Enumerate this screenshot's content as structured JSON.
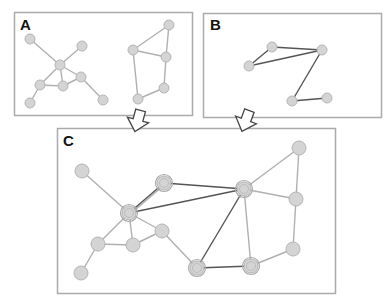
{
  "panels": {
    "A": {
      "label": "A",
      "box": [
        14,
        12,
        178,
        103
      ],
      "nodes": [
        {
          "id": "a1",
          "x": 30,
          "y": 39
        },
        {
          "id": "a2",
          "x": 82,
          "y": 46
        },
        {
          "id": "a3",
          "x": 60,
          "y": 65
        },
        {
          "id": "a4",
          "x": 81,
          "y": 77
        },
        {
          "id": "a5",
          "x": 40,
          "y": 85
        },
        {
          "id": "a6",
          "x": 63,
          "y": 86
        },
        {
          "id": "a7",
          "x": 30,
          "y": 103
        },
        {
          "id": "a8",
          "x": 103,
          "y": 100
        },
        {
          "id": "a9",
          "x": 169,
          "y": 25
        },
        {
          "id": "a10",
          "x": 133,
          "y": 50
        },
        {
          "id": "a11",
          "x": 166,
          "y": 57
        },
        {
          "id": "a12",
          "x": 164,
          "y": 88
        },
        {
          "id": "a13",
          "x": 138,
          "y": 99
        }
      ],
      "edges": [
        [
          "a1",
          "a3"
        ],
        [
          "a2",
          "a3"
        ],
        [
          "a3",
          "a5"
        ],
        [
          "a3",
          "a6"
        ],
        [
          "a3",
          "a4"
        ],
        [
          "a5",
          "a6"
        ],
        [
          "a6",
          "a4"
        ],
        [
          "a5",
          "a7"
        ],
        [
          "a4",
          "a8"
        ],
        [
          "a9",
          "a10"
        ],
        [
          "a9",
          "a11"
        ],
        [
          "a10",
          "a11"
        ],
        [
          "a10",
          "a13"
        ],
        [
          "a11",
          "a12"
        ],
        [
          "a12",
          "a13"
        ]
      ]
    },
    "B": {
      "label": "B",
      "box": [
        203,
        13,
        178,
        104
      ],
      "nodes": [
        {
          "id": "b1",
          "x": 272,
          "y": 47
        },
        {
          "id": "b2",
          "x": 249,
          "y": 66
        },
        {
          "id": "b3",
          "x": 322,
          "y": 50
        },
        {
          "id": "b4",
          "x": 292,
          "y": 101
        },
        {
          "id": "b5",
          "x": 327,
          "y": 98
        }
      ],
      "edges": [
        [
          "b1",
          "b3"
        ],
        [
          "b2",
          "b1"
        ],
        [
          "b2",
          "b3"
        ],
        [
          "b3",
          "b4"
        ],
        [
          "b4",
          "b5"
        ]
      ]
    },
    "C": {
      "label": "C",
      "box": [
        57,
        128,
        278,
        165
      ],
      "nodes": [
        {
          "id": "c1",
          "x": 82,
          "y": 171,
          "double": false
        },
        {
          "id": "c2",
          "x": 164,
          "y": 183,
          "double": true
        },
        {
          "id": "c3",
          "x": 129,
          "y": 213,
          "double": true
        },
        {
          "id": "c4",
          "x": 162,
          "y": 231,
          "double": false
        },
        {
          "id": "c5",
          "x": 98,
          "y": 244,
          "double": false
        },
        {
          "id": "c6",
          "x": 133,
          "y": 245,
          "double": false
        },
        {
          "id": "c7",
          "x": 81,
          "y": 273,
          "double": false
        },
        {
          "id": "c8",
          "x": 197,
          "y": 268,
          "double": true
        },
        {
          "id": "c9",
          "x": 299,
          "y": 148,
          "double": false
        },
        {
          "id": "c10",
          "x": 244,
          "y": 189,
          "double": true
        },
        {
          "id": "c11",
          "x": 296,
          "y": 199,
          "double": false
        },
        {
          "id": "c12",
          "x": 293,
          "y": 249,
          "double": false
        },
        {
          "id": "c13",
          "x": 251,
          "y": 266,
          "double": true
        }
      ],
      "light_edges": [
        [
          "c1",
          "c3"
        ],
        [
          "c3",
          "c2"
        ],
        [
          "c3",
          "c5"
        ],
        [
          "c3",
          "c6"
        ],
        [
          "c3",
          "c4"
        ],
        [
          "c5",
          "c6"
        ],
        [
          "c6",
          "c4"
        ],
        [
          "c5",
          "c7"
        ],
        [
          "c4",
          "c8"
        ],
        [
          "c9",
          "c10"
        ],
        [
          "c9",
          "c11"
        ],
        [
          "c10",
          "c11"
        ],
        [
          "c10",
          "c13"
        ],
        [
          "c11",
          "c12"
        ],
        [
          "c12",
          "c13"
        ]
      ],
      "dark_edges": [
        [
          "c3",
          "c2"
        ],
        [
          "c2",
          "c10"
        ],
        [
          "c3",
          "c10"
        ],
        [
          "c10",
          "c8"
        ],
        [
          "c8",
          "c13"
        ]
      ]
    }
  },
  "arrows": [
    {
      "id": "arrow-a-to-c",
      "x": 138,
      "y": 120,
      "angle": 15
    },
    {
      "id": "arrow-b-to-c",
      "x": 246,
      "y": 120,
      "angle": 20
    }
  ],
  "colors": {
    "box_border": "#aaaaaa",
    "node_fill": "#d4d4d4",
    "node_stroke": "#b5b5b5",
    "light_edge": "#b0b0b0",
    "dark_edge": "#555555"
  }
}
